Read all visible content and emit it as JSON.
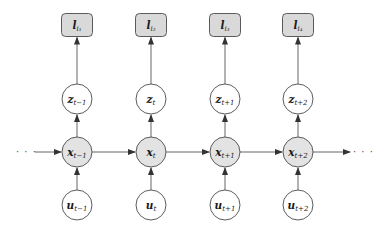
{
  "diagram": {
    "title": "",
    "colors": {
      "background": "#ffffff",
      "stroke": "#4a4a4a",
      "edge": "#555555",
      "shaded_fill": "#e3e3e3",
      "observation_fill": "#d9d9d9",
      "open_fill": "#ffffff"
    },
    "columns": [
      {
        "time": "t-1",
        "observation": {
          "base": "l",
          "sub": "i1",
          "sub_display": "i₁"
        },
        "latent": {
          "base": "z",
          "sub": "t−1"
        },
        "state": {
          "base": "x",
          "sub": "t−1"
        },
        "input": {
          "base": "u",
          "sub": "t−1"
        }
      },
      {
        "time": "t",
        "observation": {
          "base": "l",
          "sub": "i2",
          "sub_display": "i₂"
        },
        "latent": {
          "base": "z",
          "sub": "t"
        },
        "state": {
          "base": "x",
          "sub": "t"
        },
        "input": {
          "base": "u",
          "sub": "t"
        }
      },
      {
        "time": "t+1",
        "observation": {
          "base": "l",
          "sub": "i3",
          "sub_display": "i₃"
        },
        "latent": {
          "base": "z",
          "sub": "t+1"
        },
        "state": {
          "base": "x",
          "sub": "t+1"
        },
        "input": {
          "base": "u",
          "sub": "t+1"
        }
      },
      {
        "time": "t+2",
        "observation": {
          "base": "l",
          "sub": "i4",
          "sub_display": "i₄"
        },
        "latent": {
          "base": "z",
          "sub": "t+2"
        },
        "state": {
          "base": "x",
          "sub": "t+2"
        },
        "input": {
          "base": "u",
          "sub": "t+2"
        }
      }
    ],
    "ellipsis_left": "· · ·",
    "ellipsis_right": "· · ·",
    "edges": [
      {
        "from": "ellipsis_left",
        "to": "x_{t-1}"
      },
      {
        "from": "x_{t-1}",
        "to": "x_t"
      },
      {
        "from": "x_t",
        "to": "x_{t+1}"
      },
      {
        "from": "x_{t+1}",
        "to": "x_{t+2}"
      },
      {
        "from": "x_{t+2}",
        "to": "ellipsis_right"
      },
      {
        "from": "u_{t-1}",
        "to": "x_{t-1}"
      },
      {
        "from": "u_t",
        "to": "x_t"
      },
      {
        "from": "u_{t+1}",
        "to": "x_{t+1}"
      },
      {
        "from": "u_{t+2}",
        "to": "x_{t+2}"
      },
      {
        "from": "x_{t-1}",
        "to": "z_{t-1}"
      },
      {
        "from": "x_t",
        "to": "z_t"
      },
      {
        "from": "x_{t+1}",
        "to": "z_{t+1}"
      },
      {
        "from": "x_{t+2}",
        "to": "z_{t+2}"
      },
      {
        "from": "z_{t-1}",
        "to": "l_{i1}"
      },
      {
        "from": "z_t",
        "to": "l_{i2}"
      },
      {
        "from": "z_{t+1}",
        "to": "l_{i3}"
      },
      {
        "from": "z_{t+2}",
        "to": "l_{i4}"
      }
    ]
  }
}
